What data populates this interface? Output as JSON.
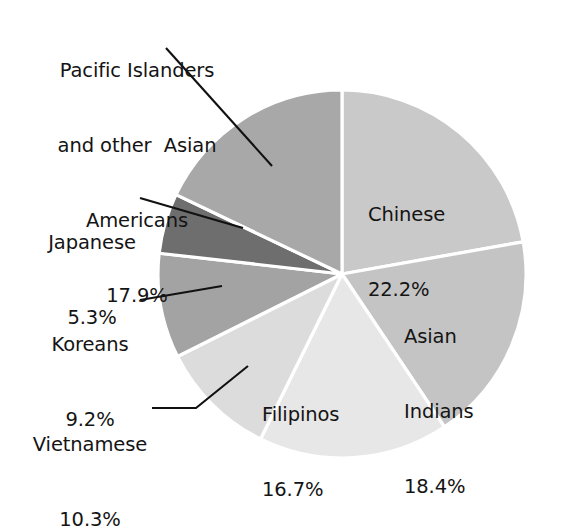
{
  "chart_data": {
    "type": "pie",
    "title": "",
    "subtitle": "",
    "xlabel": "",
    "ylabel": "",
    "legend_position": "none",
    "grid": false,
    "units": "percent",
    "start_angle_deg": 0,
    "direction": "clockwise",
    "categories": [
      "Chinese",
      "Asian Indians",
      "Filipinos",
      "Vietnamese",
      "Koreans",
      "Japanese",
      "Pacific Islanders and other  Asian Americans"
    ],
    "values": [
      22.2,
      18.4,
      16.7,
      10.3,
      9.2,
      5.3,
      17.9
    ],
    "slices": [
      {
        "name": "Chinese",
        "label_line1": "Chinese",
        "label_line2": "22.2%",
        "value": 22.2,
        "value_text": "22.2%",
        "color": "#c9c9c9",
        "label_placement": "inside"
      },
      {
        "name": "Asian Indians",
        "label_line1": "Asian",
        "label_line2": "Indians",
        "label_line3": "18.4%",
        "value": 18.4,
        "value_text": "18.4%",
        "color": "#c4c4c4",
        "label_placement": "inside"
      },
      {
        "name": "Filipinos",
        "label_line1": "Filipinos",
        "label_line2": "16.7%",
        "value": 16.7,
        "value_text": "16.7%",
        "color": "#e7e7e7",
        "label_placement": "inside"
      },
      {
        "name": "Vietnamese",
        "label_line1": "Vietnamese",
        "label_line2": "10.3%",
        "value": 10.3,
        "value_text": "10.3%",
        "color": "#dcdcdc",
        "label_placement": "outside-left"
      },
      {
        "name": "Koreans",
        "label_line1": "Koreans",
        "label_line2": "9.2%",
        "value": 9.2,
        "value_text": "9.2%",
        "color": "#a3a3a3",
        "label_placement": "outside-left"
      },
      {
        "name": "Japanese",
        "label_line1": "Japanese",
        "label_line2": "5.3%",
        "value": 5.3,
        "value_text": "5.3%",
        "color": "#6e6e6e",
        "label_placement": "outside-left"
      },
      {
        "name": "Pacific Islanders and other Asian Americans",
        "label_line1": "Pacific Islanders",
        "label_line2": "and other  Asian",
        "label_line3": "Americans",
        "label_line4": "17.9%",
        "value": 17.9,
        "value_text": "17.9%",
        "color": "#a8a8a8",
        "label_placement": "outside-top-left"
      }
    ],
    "slice_border_color": "#ffffff",
    "leader_line_color": "#111111",
    "background_color": "#ffffff"
  },
  "labels": {
    "pacific": {
      "line1": "Pacific Islanders",
      "line2": "and other  Asian",
      "line3": "Americans",
      "line4": "17.9%"
    },
    "japanese": {
      "line1": "Japanese",
      "line2": "5.3%"
    },
    "koreans": {
      "line1": "Koreans",
      "line2": "9.2%"
    },
    "vietnamese": {
      "line1": "Vietnamese",
      "line2": "10.3%"
    },
    "chinese": {
      "line1": "Chinese",
      "line2": "22.2%"
    },
    "asian_indians": {
      "line1": "Asian",
      "line2": "Indians",
      "line3": "18.4%"
    },
    "filipinos": {
      "line1": "Filipinos",
      "line2": "16.7%"
    }
  }
}
